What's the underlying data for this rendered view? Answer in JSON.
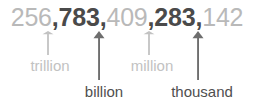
{
  "figure": {
    "type": "place-value-diagram",
    "background_color": "#ffffff",
    "light_color": "#b9b9b9",
    "dark_color": "#4a4a4a"
  },
  "number": {
    "full_text": "256,783,409,283,142",
    "separator": ",",
    "groups": [
      {
        "digits": "256",
        "emphasis": "light"
      },
      {
        "digits": "783",
        "emphasis": "dark"
      },
      {
        "digits": "409",
        "emphasis": "light"
      },
      {
        "digits": "283",
        "emphasis": "dark"
      },
      {
        "digits": "142",
        "emphasis": "light"
      }
    ]
  },
  "annotations": [
    {
      "label": "trillion",
      "emphasis": "light",
      "arrow_color": "#c2c2c2",
      "label_color": "#c2c2c2",
      "arrow_x": 48,
      "arrow_top": 31,
      "arrow_length": 24,
      "label_x": 50,
      "label_y": 58,
      "row": "upper"
    },
    {
      "label": "billion",
      "emphasis": "dark",
      "arrow_color": "#6e6e6e",
      "label_color": "#4f4f4f",
      "arrow_x": 99,
      "arrow_top": 31,
      "arrow_length": 49,
      "label_x": 104,
      "label_y": 84,
      "row": "lower"
    },
    {
      "label": "million",
      "emphasis": "light",
      "arrow_color": "#c2c2c2",
      "label_color": "#c2c2c2",
      "arrow_x": 149,
      "arrow_top": 31,
      "arrow_length": 24,
      "label_x": 152,
      "label_y": 58,
      "row": "upper"
    },
    {
      "label": "thousand",
      "emphasis": "dark",
      "arrow_color": "#6e6e6e",
      "label_color": "#4f4f4f",
      "arrow_x": 198,
      "arrow_top": 31,
      "arrow_length": 49,
      "label_x": 202,
      "label_y": 84,
      "row": "lower"
    }
  ]
}
